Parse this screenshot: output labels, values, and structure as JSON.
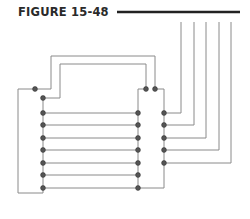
{
  "figure": {
    "label": "FIGURE 15-48",
    "rule_color": "#222222"
  },
  "diagram": {
    "wire_color": "#7a7a7a",
    "node_color": "#555555",
    "external_leads_count": 5,
    "left_column_nodes": 8,
    "right_column_nodes": 8,
    "right_outer_nodes": 5,
    "top_nodes": 3
  }
}
